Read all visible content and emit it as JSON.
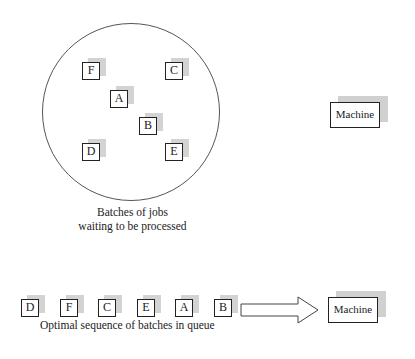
{
  "pool": {
    "caption_line1": "Batches of jobs",
    "caption_line2": "waiting to be processed",
    "jobs": [
      {
        "label": "F",
        "x": 82,
        "y": 62
      },
      {
        "label": "C",
        "x": 165,
        "y": 62
      },
      {
        "label": "A",
        "x": 110,
        "y": 90
      },
      {
        "label": "B",
        "x": 139,
        "y": 117
      },
      {
        "label": "D",
        "x": 82,
        "y": 143
      },
      {
        "label": "E",
        "x": 165,
        "y": 143
      }
    ]
  },
  "top_machine": {
    "label": "Machine"
  },
  "queue": {
    "caption": "Optimal sequence of batches in queue",
    "jobs": [
      "D",
      "F",
      "C",
      "E",
      "A",
      "B"
    ]
  },
  "bottom_machine": {
    "label": "Machine"
  }
}
